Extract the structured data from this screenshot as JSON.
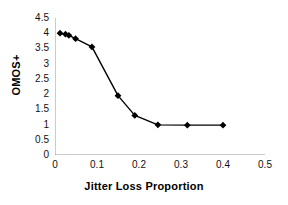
{
  "chart_data": {
    "type": "line",
    "title": "",
    "xlabel": "Jitter Loss Proportion",
    "ylabel": "OMOS+",
    "xlim": [
      0,
      0.5
    ],
    "ylim": [
      0,
      4.5
    ],
    "xticks": [
      "0",
      "0.1",
      "0.2",
      "0.3",
      "0.4",
      "0.5"
    ],
    "xtick_values": [
      0,
      0.1,
      0.2,
      0.3,
      0.4,
      0.5
    ],
    "yticks": [
      "0",
      "0.5",
      "1",
      "1.5",
      "2",
      "2.5",
      "3",
      "3.5",
      "4",
      "4.5"
    ],
    "ytick_values": [
      0,
      0.5,
      1,
      1.5,
      2,
      2.5,
      3,
      3.5,
      4,
      4.5
    ],
    "grid": false,
    "legend": null,
    "marker": "diamond",
    "marker_color": "#000000",
    "line_color": "#000000",
    "series": [
      {
        "name": "OMOS+",
        "x": [
          0.012,
          0.025,
          0.033,
          0.049,
          0.088,
          0.15,
          0.19,
          0.245,
          0.315,
          0.4
        ],
        "y": [
          4.0,
          3.97,
          3.93,
          3.82,
          3.55,
          1.95,
          1.3,
          0.99,
          0.98,
          0.98
        ]
      }
    ]
  },
  "axes": {
    "x_axis_name": "x-axis",
    "y_axis_name": "y-axis"
  }
}
